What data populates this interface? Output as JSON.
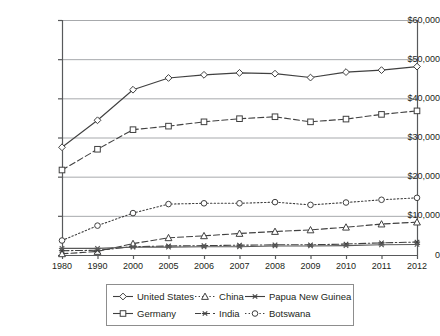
{
  "chart_data": {
    "type": "line",
    "title": "",
    "xlabel": "",
    "ylabel": "",
    "categories": [
      "1980",
      "1990",
      "2000",
      "2005",
      "2006",
      "2007",
      "2008",
      "2009",
      "2010",
      "2011",
      "2012"
    ],
    "ylim": [
      0,
      60000
    ],
    "ytick_labels": [
      "$60,000",
      "$50,000",
      "$40,000",
      "$30,000",
      "$20,000",
      "$10,000",
      "0"
    ],
    "ytick_values": [
      60000,
      50000,
      40000,
      30000,
      20000,
      10000,
      0
    ],
    "grid": "horizontal",
    "legend_position": "bottom",
    "series": [
      {
        "name": "United States",
        "marker": "diamond",
        "line_style": "solid",
        "color": "#404040",
        "values": [
          27500,
          34400,
          42200,
          45200,
          46000,
          46500,
          46300,
          45300,
          46700,
          47200,
          48100
        ]
      },
      {
        "name": "Germany",
        "marker": "square",
        "line_style": "dashed",
        "color": "#404040",
        "values": [
          21700,
          27000,
          32000,
          32900,
          34000,
          34800,
          35300,
          34000,
          34700,
          35900,
          36800
        ]
      },
      {
        "name": "China",
        "marker": "triangle",
        "line_style": "dashed",
        "color": "#404040",
        "values": [
          300,
          900,
          2900,
          4400,
          4900,
          5500,
          6000,
          6400,
          7100,
          7900,
          8400
        ]
      },
      {
        "name": "India",
        "marker": "asterisk",
        "line_style": "dashdot",
        "color": "#404040",
        "values": [
          1100,
          1200,
          2100,
          2300,
          2400,
          2500,
          2600,
          2600,
          2800,
          3100,
          3300
        ]
      },
      {
        "name": "Papua New Guinea",
        "marker": "asterisk",
        "line_style": "solid",
        "color": "#595959",
        "values": [
          1700,
          1700,
          2000,
          2000,
          2100,
          2100,
          2300,
          2300,
          2400,
          2600,
          2700
        ]
      },
      {
        "name": "Botswana",
        "marker": "circle",
        "line_style": "dotted",
        "color": "#404040",
        "values": [
          3700,
          7500,
          10700,
          13000,
          13200,
          13200,
          13500,
          12800,
          13400,
          14100,
          14600
        ]
      }
    ]
  },
  "legend": {
    "entries": [
      {
        "label": "United States",
        "marker": "diamond",
        "line_style": "solid"
      },
      {
        "label": "China",
        "marker": "triangle",
        "line_style": "dotted"
      },
      {
        "label": "Papua New Guinea",
        "marker": "asterisk",
        "line_style": "solid"
      },
      {
        "label": "Germany",
        "marker": "square",
        "line_style": "solid"
      },
      {
        "label": "India",
        "marker": "asterisk",
        "line_style": "dashed"
      },
      {
        "label": "Botswana",
        "marker": "circle",
        "line_style": "dotted"
      }
    ]
  },
  "colors": {
    "ink": "#231f20",
    "axis": "#58595b",
    "grid": "#a7a9ac",
    "line": "#404040",
    "background": "#ffffff"
  }
}
